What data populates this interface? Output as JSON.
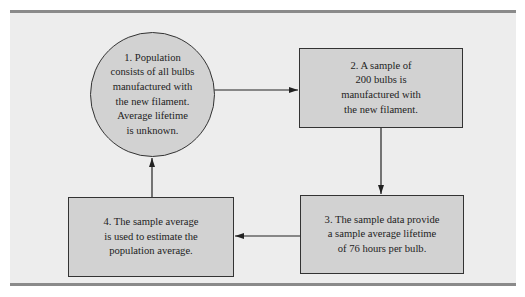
{
  "diagram": {
    "type": "flowchart-cycle",
    "colors": {
      "background": "#ededed",
      "node_fill": "#d2d2d2",
      "border": "#333333",
      "rule": "#8a8a8a"
    },
    "nodes": [
      {
        "id": 1,
        "shape": "circle",
        "text": "1.  Population\nconsists of all bulbs\nmanufactured with\nthe new filament.\nAverage lifetime\nis unknown."
      },
      {
        "id": 2,
        "shape": "rectangle",
        "text": "2.  A sample of\n200 bulbs is\nmanufactured with\nthe new filament."
      },
      {
        "id": 3,
        "shape": "rectangle",
        "text": "3.  The sample data provide\na sample average lifetime\nof 76 hours per bulb."
      },
      {
        "id": 4,
        "shape": "rectangle",
        "text": "4.  The sample average\nis used to estimate the\npopulation average."
      }
    ],
    "edges": [
      {
        "from": 1,
        "to": 2,
        "direction": "right"
      },
      {
        "from": 2,
        "to": 3,
        "direction": "down"
      },
      {
        "from": 3,
        "to": 4,
        "direction": "left"
      },
      {
        "from": 4,
        "to": 1,
        "direction": "up"
      }
    ]
  }
}
